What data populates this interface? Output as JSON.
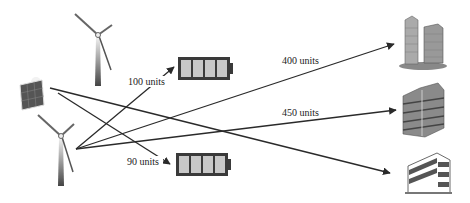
{
  "sources": [
    {
      "id": "wind-turbine-top",
      "type": "wind-turbine-icon"
    },
    {
      "id": "solar-panel",
      "type": "solar-panel-icon"
    },
    {
      "id": "wind-turbine-bottom",
      "type": "wind-turbine-icon"
    }
  ],
  "storage": [
    {
      "id": "battery-top",
      "type": "battery-icon",
      "label": "100 units"
    },
    {
      "id": "battery-bottom",
      "type": "battery-icon",
      "label": "90 units"
    }
  ],
  "consumers": [
    {
      "id": "building-top",
      "type": "office-towers-icon",
      "label": "400 units"
    },
    {
      "id": "building-middle",
      "type": "apartment-block-icon",
      "label": "450 units"
    },
    {
      "id": "building-bottom",
      "type": "office-building-icon",
      "label": ""
    }
  ],
  "colors": {
    "line": "#2a2a2a",
    "battery_body": "#3a3a3a",
    "battery_cell": "#c8c8c8",
    "building": "#7a7a7a"
  }
}
